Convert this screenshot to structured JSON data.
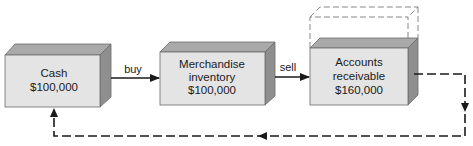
{
  "diagram": {
    "type": "operating-cycle-flow",
    "boxes": [
      {
        "id": "cash",
        "lines": [
          "Cash",
          "$100,000"
        ]
      },
      {
        "id": "merchandise",
        "lines": [
          "Merchandise",
          "inventory",
          "$100,000"
        ]
      },
      {
        "id": "receivables",
        "lines": [
          "Accounts",
          "receivable",
          "$160,000"
        ],
        "expanded_dashed_outline": true
      }
    ],
    "edges": [
      {
        "from": "cash",
        "to": "merchandise",
        "label": "buy",
        "style": "solid"
      },
      {
        "from": "merchandise",
        "to": "receivables",
        "label": "sell",
        "style": "solid"
      },
      {
        "from": "receivables",
        "to": "cash",
        "label": "",
        "style": "dashed"
      }
    ],
    "colors": {
      "front_face": "#e4e4e4",
      "top_face": "#a9a9a9",
      "side_face": "#8f8f8f",
      "outline": "#6a6a6a",
      "line": "#1a1a1a"
    }
  }
}
